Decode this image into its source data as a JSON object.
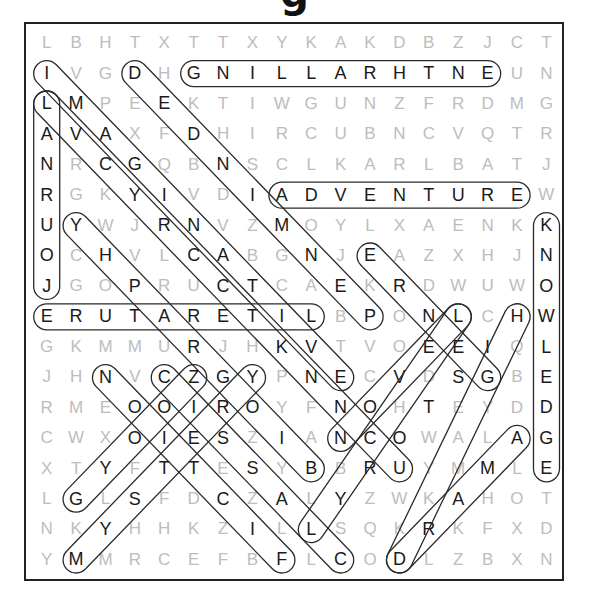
{
  "puzzle": {
    "title_fragment": "g",
    "grid": [
      "LBHTXTTXYKAKDBZJCT",
      "IVGDHGNILLARHTNEUN",
      "LMPEEKTIWGUNZFRDMG",
      "AVAXFDHIRCUBNCVQTR",
      "NRCGQBNSCLKARLBATJ",
      "RGKYIVDIADVENTUREW",
      "UYWJRNVZMOYLXAENKK",
      "OCHVLCABGNJEAZXHJN",
      "JGOPRUCTCAEKRDWUWO",
      "ERUTARETILBPONLCHW",
      "GKMMURJHKVTVOEEIQL",
      "JHNVCZGYPNECVDSGBE",
      "RMEOOIROYFNOHTEYDD",
      "CWXOIESZIANCOWALAG",
      "XTYFTTESYBBRUYMMLE",
      "LGLSFDCZALYZWKAHOT",
      "NKYHHKZILLSQKRKFXD",
      "YMMRCEFBFLCODLZBXN"
    ],
    "found_words": [
      {
        "word": "ENTHRALLING",
        "start": [
          1,
          15
        ],
        "end": [
          1,
          5
        ]
      },
      {
        "word": "ADVENTURE",
        "start": [
          5,
          8
        ],
        "end": [
          5,
          16
        ]
      },
      {
        "word": "LITERATURE",
        "start": [
          9,
          9
        ],
        "end": [
          9,
          0
        ]
      },
      {
        "word": "JOURNAL",
        "start": [
          8,
          0
        ],
        "end": [
          2,
          0
        ]
      },
      {
        "word": "KNOWLEDGE",
        "start": [
          6,
          17
        ],
        "end": [
          14,
          17
        ]
      },
      {
        "word": "IMAGINATION",
        "start": [
          1,
          0
        ],
        "end": [
          11,
          10
        ]
      },
      {
        "word": "DEDICATED",
        "start": [
          1,
          3
        ],
        "end": [
          9,
          11
        ]
      },
      {
        "word": "YHPARGOIB",
        "start": [
          6,
          1
        ],
        "end": [
          14,
          9
        ]
      },
      {
        "word": "ERLOS",
        "start": [
          7,
          11
        ],
        "end": [
          11,
          14
        ]
      },
      {
        "word": "HIGH",
        "start": [
          9,
          16
        ],
        "end": [
          11,
          15
        ]
      },
      {
        "word": "NOISICED",
        "start": [
          11,
          2
        ],
        "end": [
          18,
          9
        ]
      },
      {
        "word": "CRESCENDO",
        "start": [
          11,
          4
        ],
        "end": [
          17,
          10
        ]
      },
      {
        "word": "GYROSTEPS",
        "start": [
          11,
          7
        ],
        "end": [
          17,
          1
        ]
      },
      {
        "word": "YITSYM",
        "start": [
          11,
          7
        ],
        "end": [
          17,
          1
        ]
      },
      {
        "word": "LOVE",
        "start": [
          9,
          14
        ],
        "end": [
          12,
          11
        ]
      },
      {
        "word": "DRAMA",
        "start": [
          17,
          12
        ],
        "end": [
          13,
          16
        ]
      },
      {
        "word": "NOVEL",
        "start": [
          13,
          10
        ],
        "end": [
          9,
          14
        ]
      },
      {
        "word": "YRONOH",
        "start": [
          15,
          10
        ],
        "end": [
          10,
          15
        ]
      }
    ]
  }
}
